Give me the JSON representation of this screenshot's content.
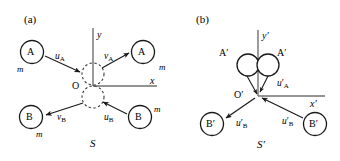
{
  "figure": {
    "type": "physics-diagram",
    "stroke_color": "#1a1a1a",
    "axis_color": "#6e6e6e",
    "dashed_color": "#444444"
  },
  "panel_a": {
    "tag": "(a)",
    "frame_label": "S",
    "axis_x_label": "x",
    "axis_y_label": "y",
    "origin_label": "O",
    "bodies": [
      {
        "name": "A-incoming",
        "label": "A",
        "mass": "m"
      },
      {
        "name": "A-outgoing",
        "label": "A",
        "mass": "m"
      },
      {
        "name": "B-outgoing",
        "label": "B",
        "mass": "m"
      },
      {
        "name": "B-incoming",
        "label": "B",
        "mass": "m"
      }
    ],
    "velocities": [
      {
        "name": "u-A",
        "symbol": "u",
        "subscript": "A",
        "prime": false
      },
      {
        "name": "v-A",
        "symbol": "v",
        "subscript": "A",
        "prime": false
      },
      {
        "name": "v-B",
        "symbol": "v",
        "subscript": "B",
        "prime": false
      },
      {
        "name": "u-B",
        "symbol": "u",
        "subscript": "B",
        "prime": false
      }
    ]
  },
  "panel_b": {
    "tag": "(b)",
    "frame_label": "S′",
    "axis_x_label": "x′",
    "axis_y_label": "y′",
    "origin_label": "O′",
    "bodies": [
      {
        "name": "A-prime-left",
        "label": "A′"
      },
      {
        "name": "A-prime-right",
        "label": "A′"
      },
      {
        "name": "B-prime-left",
        "label": "B′"
      },
      {
        "name": "B-prime-right",
        "label": "B′"
      }
    ],
    "velocities": [
      {
        "name": "u-prime-A",
        "symbol": "u",
        "subscript": "A",
        "prime": true
      },
      {
        "name": "u-prime-B-left",
        "symbol": "u",
        "subscript": "B",
        "prime": true
      },
      {
        "name": "u-prime-B-right",
        "symbol": "u",
        "subscript": "B",
        "prime": true
      }
    ]
  }
}
